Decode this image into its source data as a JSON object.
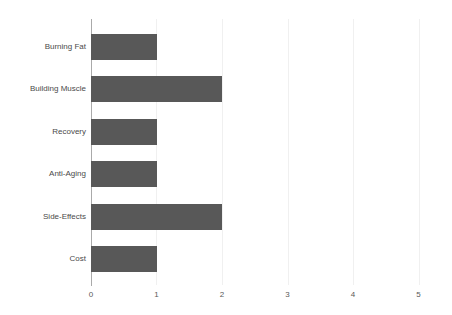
{
  "chart_data": {
    "type": "bar",
    "orientation": "horizontal",
    "title": "",
    "subtitle": "",
    "xlabel": "",
    "ylabel": "",
    "categories": [
      "Burning Fat",
      "Building Muscle",
      "Recovery",
      "Anti-Aging",
      "Side-Effects",
      "Cost"
    ],
    "values": [
      1,
      2,
      1,
      1,
      2,
      1
    ],
    "xticks": [
      "0",
      "1",
      "2",
      "3",
      "4",
      "5"
    ],
    "xtick_values": [
      0,
      1,
      2,
      3,
      4,
      5
    ],
    "xlim": [
      0,
      5
    ],
    "grid": true,
    "grid_axis": "x",
    "legend": false,
    "legend_position": "none",
    "bar_color": "#585858",
    "gridline_color": "#f0f0f0",
    "axis_color": "#aaaaaa",
    "label_color": "#4a4a4a",
    "tick_color": "#595959",
    "background_color": "#ffffff"
  }
}
